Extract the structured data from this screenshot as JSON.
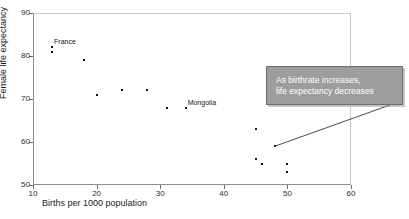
{
  "chart_data": {
    "type": "scatter",
    "title": "",
    "xlabel": "Births per 1000 population",
    "ylabel": "Female life expectancy",
    "xlim": [
      10,
      60
    ],
    "ylim": [
      50,
      90
    ],
    "xticks": [
      10,
      20,
      30,
      40,
      50,
      60
    ],
    "yticks": [
      50,
      60,
      70,
      80,
      90
    ],
    "grid": false,
    "legend": "none",
    "series": [
      {
        "name": "countries",
        "points": [
          {
            "x": 13,
            "y": 82
          },
          {
            "x": 13,
            "y": 81
          },
          {
            "x": 18,
            "y": 79
          },
          {
            "x": 20,
            "y": 71
          },
          {
            "x": 24,
            "y": 72
          },
          {
            "x": 28,
            "y": 72
          },
          {
            "x": 31,
            "y": 68
          },
          {
            "x": 34,
            "y": 68
          },
          {
            "x": 45,
            "y": 63
          },
          {
            "x": 48,
            "y": 59
          },
          {
            "x": 45,
            "y": 56
          },
          {
            "x": 46,
            "y": 55
          },
          {
            "x": 50,
            "y": 55
          },
          {
            "x": 50,
            "y": 53
          }
        ]
      }
    ],
    "point_labels": [
      {
        "text": "France",
        "x": 13,
        "y": 82,
        "dx": 2,
        "dy": -9
      },
      {
        "text": "Mongolia",
        "x": 34,
        "y": 68,
        "dx": 2,
        "dy": -9
      }
    ],
    "annotations": [
      {
        "id": "callout",
        "lines": [
          "As birthrate increases,",
          "life expectancy decreases"
        ],
        "anchor_point": {
          "x": 48,
          "y": 59
        },
        "background_color": "#9d9d9d",
        "text_color": "#ffffff",
        "border_color": "#6e6e6e"
      }
    ],
    "colors": {
      "point": "#111111",
      "axis": "#8e8e8e",
      "text": "#1a1a1a"
    }
  }
}
